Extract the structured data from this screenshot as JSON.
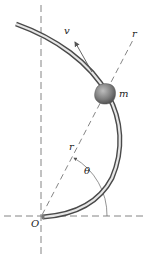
{
  "diagram": {
    "labels": {
      "velocity": "v",
      "radial_axis": "r",
      "mass": "m",
      "radius": "r",
      "angle": "θ",
      "origin": "O"
    },
    "colors": {
      "line": "#555555",
      "rod_dark": "#4a4a4a",
      "rod_light": "#e8e8e8",
      "bead": "#7a7a7a",
      "text": "#222222"
    }
  }
}
